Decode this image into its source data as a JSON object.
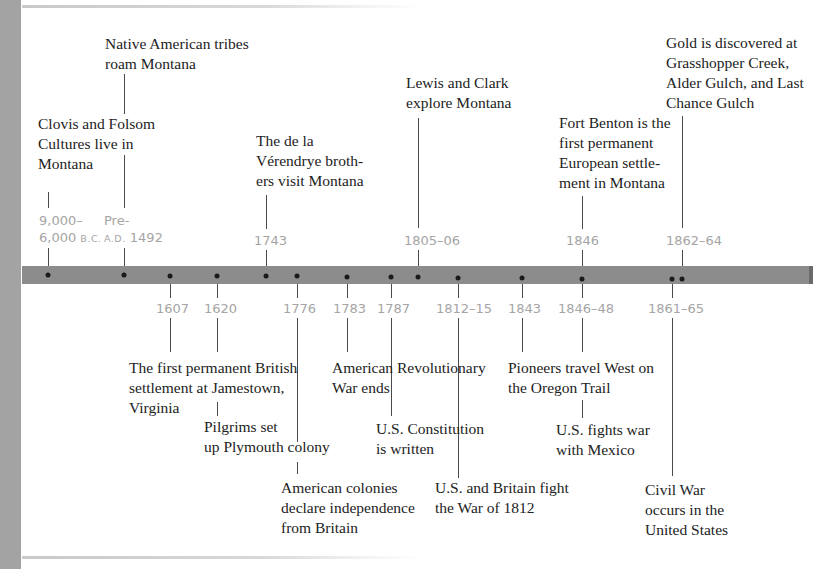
{
  "timeline": {
    "colors": {
      "bar": "#8c8c8c",
      "date_text": "#a5a5a5",
      "event_text": "#222222",
      "side_strip": "#a3a3a3",
      "dot": "#1a1a1a"
    },
    "above": [
      {
        "date_line1": "9,000–",
        "date_line2_main": "6,000 ",
        "date_line2_sc": "B.C.",
        "text": [
          "Clovis and Folsom",
          "Cultures live in",
          "Montana"
        ]
      },
      {
        "date_line1": "Pre-",
        "date_line2_sc": "A.D.",
        "date_line2_main": " 1492",
        "text": [
          "Native American tribes",
          "roam Montana"
        ]
      },
      {
        "date": "1743",
        "text": [
          "The de la",
          "Vérendrye broth-",
          "ers visit Montana"
        ]
      },
      {
        "date": "1805–06",
        "text": [
          "Lewis and Clark",
          "explore Montana"
        ]
      },
      {
        "date": "1846",
        "text": [
          "Fort Benton is the",
          "first permanent",
          "European settle-",
          "ment in Montana"
        ]
      },
      {
        "date": "1862–64",
        "text": [
          "Gold is discovered at",
          "Grasshopper Creek,",
          "Alder Gulch, and Last",
          "Chance Gulch"
        ]
      }
    ],
    "below": [
      {
        "date": "1607",
        "text": [
          "The first permanent British",
          "settlement at Jamestown,",
          "Virginia"
        ]
      },
      {
        "date": "1620",
        "text": [
          "Pilgrims set",
          "up Plymouth colony"
        ]
      },
      {
        "date": "1776",
        "text": [
          "American colonies",
          "declare independence",
          "from Britain"
        ]
      },
      {
        "date": "1783",
        "text": [
          "American Revolutionary",
          "War ends"
        ]
      },
      {
        "date": "1787",
        "text": [
          "U.S. Constitution",
          "is written"
        ]
      },
      {
        "date": "1812–15",
        "text": [
          "U.S. and Britain fight",
          "the War of 1812"
        ]
      },
      {
        "date": "1843",
        "text": [
          "Pioneers travel West on",
          "the Oregon Trail"
        ]
      },
      {
        "date": "1846–48",
        "text": [
          "U.S. fights war",
          "with Mexico"
        ]
      },
      {
        "date": "1861–65",
        "text": [
          "Civil War",
          "occurs in the",
          "United States"
        ]
      }
    ]
  }
}
